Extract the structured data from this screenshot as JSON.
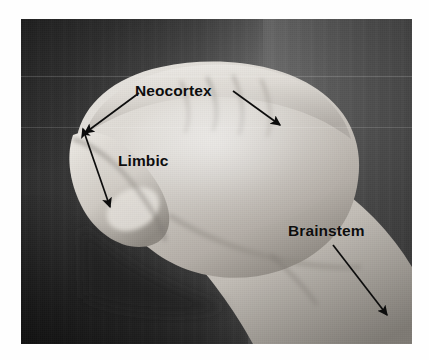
{
  "image": {
    "kind": "annotated-photograph",
    "subject": "hand-model-of-the-brain",
    "description": "Grayscale photo of a closed fist with the thumb folded inside, labelled as a model of the brain",
    "frame": {
      "left": 21,
      "top": 19,
      "width": 391,
      "height": 325
    },
    "page_background": "#ffffff",
    "photo_background": "#3a3a3a"
  },
  "annotations": {
    "color": "#0d0d0d",
    "items": [
      {
        "id": "neocortex",
        "label": "Neocortex",
        "arrows": [
          {
            "name": "neocortex-arrow-left",
            "from": [
              118,
              74
            ],
            "to": [
              64,
              114
            ]
          },
          {
            "name": "neocortex-arrow-right",
            "from": [
              210,
              74
            ],
            "to": [
              258,
              107
            ]
          }
        ]
      },
      {
        "id": "limbic",
        "label": "Limbic",
        "arrows": [
          {
            "name": "limbic-arrow",
            "from": [
              62,
              110
            ],
            "to": [
              88,
              187
            ],
            "double_headed": true
          }
        ]
      },
      {
        "id": "brainstem",
        "label": "Brainstem",
        "arrows": [
          {
            "name": "brainstem-arrow",
            "from": [
              312,
              226
            ],
            "to": [
              365,
              295
            ]
          }
        ]
      }
    ]
  },
  "palette": {
    "skin_light": "#ededea",
    "skin_mid": "#cfcbc6",
    "skin_shadow": "#9a958f",
    "skin_deep": "#6e6a66",
    "backdrop_dark": "#2b2b2b",
    "backdrop_light": "#565656",
    "ink": "#0d0d0d"
  }
}
